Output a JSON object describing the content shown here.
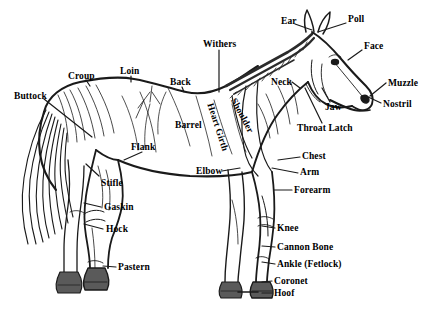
{
  "diagram": {
    "colors": {
      "ink": "#1a1a1a",
      "background": "#ffffff",
      "hoof_shade": "#5a5a5a",
      "mane_shade": "#2b2b2b"
    },
    "labels": [
      {
        "id": "buttock",
        "text": "Buttock",
        "x": 14,
        "y": 92,
        "rotate": 0
      },
      {
        "id": "croup",
        "text": "Croup",
        "x": 68,
        "y": 72,
        "rotate": 0
      },
      {
        "id": "loin",
        "text": "Loin",
        "x": 120,
        "y": 67,
        "rotate": 0
      },
      {
        "id": "back",
        "text": "Back",
        "x": 170,
        "y": 78,
        "rotate": 0
      },
      {
        "id": "withers",
        "text": "Withers",
        "x": 203,
        "y": 40,
        "rotate": 0
      },
      {
        "id": "barrel",
        "text": "Barrel",
        "x": 175,
        "y": 121,
        "rotate": 0
      },
      {
        "id": "flank",
        "text": "Flank",
        "x": 131,
        "y": 143,
        "rotate": 0
      },
      {
        "id": "stifle",
        "text": "Stifle",
        "x": 101,
        "y": 179,
        "rotate": 0
      },
      {
        "id": "gaskin",
        "text": "Gaskin",
        "x": 104,
        "y": 203,
        "rotate": 0
      },
      {
        "id": "hock",
        "text": "Hock",
        "x": 106,
        "y": 225,
        "rotate": 0
      },
      {
        "id": "pastern",
        "text": "Pastern",
        "x": 118,
        "y": 263,
        "rotate": 0
      },
      {
        "id": "heart-girth",
        "text": "Heart Girth",
        "x": 214,
        "y": 102,
        "rotate": 72
      },
      {
        "id": "shoulder",
        "text": "Shoulder",
        "x": 237,
        "y": 97,
        "rotate": 62
      },
      {
        "id": "elbow",
        "text": "Elbow",
        "x": 196,
        "y": 167,
        "rotate": 0
      },
      {
        "id": "neck",
        "text": "Neck",
        "x": 271,
        "y": 78,
        "rotate": 0
      },
      {
        "id": "ear",
        "text": "Ear",
        "x": 281,
        "y": 17,
        "rotate": 0
      },
      {
        "id": "poll",
        "text": "Poll",
        "x": 348,
        "y": 15,
        "rotate": 0
      },
      {
        "id": "face",
        "text": "Face",
        "x": 364,
        "y": 42,
        "rotate": 0
      },
      {
        "id": "muzzle",
        "text": "Muzzle",
        "x": 388,
        "y": 79,
        "rotate": 0
      },
      {
        "id": "nostril",
        "text": "Nostril",
        "x": 383,
        "y": 100,
        "rotate": 0
      },
      {
        "id": "jaw",
        "text": "Jaw",
        "x": 325,
        "y": 103,
        "rotate": 0
      },
      {
        "id": "throat-latch",
        "text": "Throat Latch",
        "x": 297,
        "y": 124,
        "rotate": 0
      },
      {
        "id": "chest",
        "text": "Chest",
        "x": 302,
        "y": 152,
        "rotate": 0
      },
      {
        "id": "arm",
        "text": "Arm",
        "x": 300,
        "y": 168,
        "rotate": 0
      },
      {
        "id": "forearm",
        "text": "Forearm",
        "x": 294,
        "y": 186,
        "rotate": 0
      },
      {
        "id": "knee",
        "text": "Knee",
        "x": 277,
        "y": 224,
        "rotate": 0
      },
      {
        "id": "cannon-bone",
        "text": "Cannon Bone",
        "x": 277,
        "y": 243,
        "rotate": 0
      },
      {
        "id": "ankle-fetlock",
        "text": "Ankle (Fetlock)",
        "x": 277,
        "y": 260,
        "rotate": 0
      },
      {
        "id": "coronet",
        "text": "Coronet",
        "x": 274,
        "y": 277,
        "rotate": 0
      },
      {
        "id": "hoof",
        "text": "Hoof",
        "x": 274,
        "y": 289,
        "rotate": 0
      }
    ]
  }
}
